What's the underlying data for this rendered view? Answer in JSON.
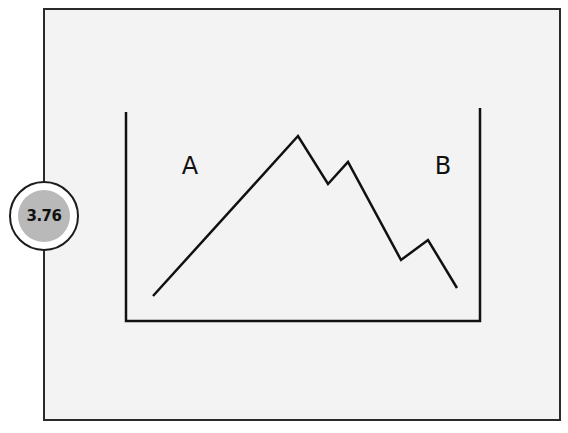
{
  "badge": {
    "value": "3.76",
    "inner_color": "#b9b9b9"
  },
  "diagram": {
    "label_left": "A",
    "label_right": "B",
    "line_points": [
      [
        153,
        296
      ],
      [
        298,
        136
      ],
      [
        328,
        184
      ],
      [
        348,
        162
      ],
      [
        401,
        260
      ],
      [
        428,
        240
      ],
      [
        457,
        288
      ]
    ],
    "container_shape": "open-top-box",
    "stroke_color": "#111111"
  },
  "panel": {
    "background": "#f3f3f3",
    "border_color": "#2a2a2a"
  }
}
